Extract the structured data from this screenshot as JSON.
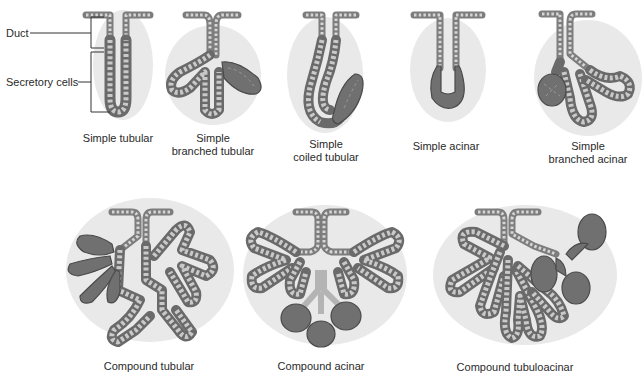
{
  "figure": {
    "annotations": {
      "duct": "Duct",
      "secretory_cells": "Secretory cells"
    },
    "glands": [
      {
        "id": "simple-tubular",
        "line1": "Simple tubular",
        "line2": ""
      },
      {
        "id": "simple-branched-tubular",
        "line1": "Simple",
        "line2": "branched tubular"
      },
      {
        "id": "simple-coiled-tubular",
        "line1": "Simple",
        "line2": "coiled tubular"
      },
      {
        "id": "simple-acinar",
        "line1": "Simple acinar",
        "line2": ""
      },
      {
        "id": "simple-branched-acinar",
        "line1": "Simple",
        "line2": "branched acinar"
      },
      {
        "id": "compound-tubular",
        "line1": "Compound tubular",
        "line2": ""
      },
      {
        "id": "compound-acinar",
        "line1": "Compound acinar",
        "line2": ""
      },
      {
        "id": "compound-tubuloacinar",
        "line1": "Compound tubuloacinar",
        "line2": ""
      }
    ],
    "colors": {
      "background": "#ffffff",
      "tissue_halo": "#e9e9e9",
      "duct_cells": "#7d7d7d",
      "secretory_cells": "#707070",
      "text": "#2a2a2a"
    }
  }
}
